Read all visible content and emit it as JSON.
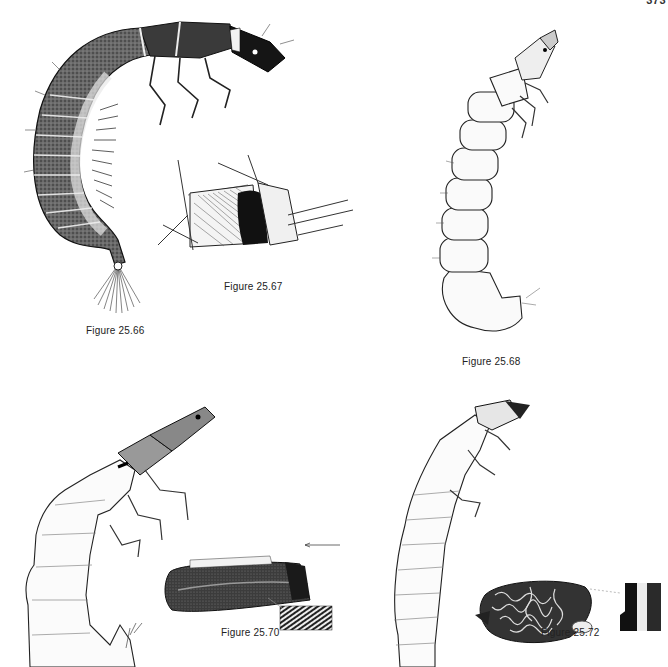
{
  "page": {
    "page_number": "373",
    "background": "#ffffff",
    "ink_color": "#111111"
  },
  "figures": [
    {
      "id": "25.66",
      "caption": "Figure 25.66",
      "subject": "caddisfly larva, dark sclerotized thorax, curved abdomen with gills, anal brush"
    },
    {
      "id": "25.67",
      "caption": "Figure 25.67",
      "subject": "larval retreat / capture net among twigs"
    },
    {
      "id": "25.68",
      "caption": "Figure 25.68",
      "subject": "slender pale caddisfly larva, J-shaped body"
    },
    {
      "id": "25.70",
      "caption": "Figure 25.70",
      "subject": "larva with dark head; tubular case with inset detail",
      "annotation": "arrow-left"
    },
    {
      "id": "25.72",
      "caption": "Figure 25.72",
      "subject": "larva; mineral case with vermiform pattern and cross-section inset"
    }
  ]
}
